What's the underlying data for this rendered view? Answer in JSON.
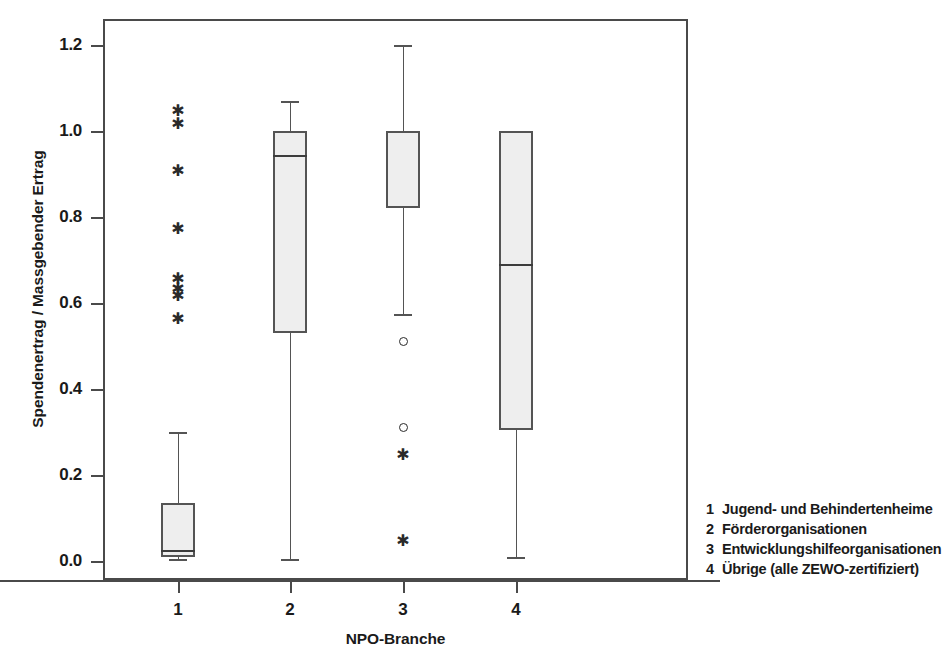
{
  "chart_data": {
    "type": "box",
    "title": "",
    "xlabel": "NPO-Branche",
    "ylabel": "Spendenertrag / Massgebender Ertrag",
    "xlim": [
      0.5,
      4.5
    ],
    "ylim": [
      -0.04,
      1.27
    ],
    "grid": false,
    "legend_position": "right-bottom",
    "x_tick_labels": [
      "1",
      "2",
      "3",
      "4"
    ],
    "y_tick_labels": [
      "0.0",
      "0.2",
      "0.4",
      "0.6",
      "0.8",
      "1.0",
      "1.2"
    ],
    "y_tick_values": [
      0.0,
      0.2,
      0.4,
      0.6,
      0.8,
      1.0,
      1.2
    ],
    "categories": [
      "1",
      "2",
      "3",
      "4"
    ],
    "boxes": [
      {
        "category": "1",
        "name": "Jugend- und Behindertenheime",
        "whisker_low": 0.005,
        "q1": 0.01,
        "median": 0.025,
        "q3": 0.135,
        "whisker_high": 0.3,
        "outliers_mild": [],
        "outliers_extreme": [
          1.04,
          1.01,
          0.9,
          0.765,
          0.65,
          0.625,
          0.61,
          0.555
        ]
      },
      {
        "category": "2",
        "name": "Förderorganisationen",
        "whisker_low": 0.005,
        "q1": 0.53,
        "median": 0.945,
        "q3": 1.0,
        "whisker_high": 1.07,
        "outliers_mild": [],
        "outliers_extreme": []
      },
      {
        "category": "3",
        "name": "Entwicklungshilfeorganisationen",
        "whisker_low": 0.575,
        "q1": 0.82,
        "median": 0.82,
        "q3": 1.0,
        "whisker_high": 1.2,
        "outliers_mild": [
          0.51,
          0.31
        ],
        "outliers_extreme": [
          0.24,
          0.04
        ]
      },
      {
        "category": "4",
        "name": "Übrige (alle ZEWO-zertifiziert)",
        "whisker_low": 0.01,
        "q1": 0.305,
        "median": 0.69,
        "q3": 1.0,
        "whisker_high": 1.0,
        "outliers_mild": [],
        "outliers_extreme": []
      }
    ]
  },
  "legend": {
    "items": [
      {
        "key": "1",
        "label": "Jugend- und Behindertenheime"
      },
      {
        "key": "2",
        "label": "Förderorganisationen"
      },
      {
        "key": "3",
        "label": "Entwicklungshilfeorganisationen"
      },
      {
        "key": "4",
        "label": "Übrige (alle ZEWO-zertifiziert)"
      }
    ]
  },
  "colors": {
    "box_fill": "#eeeeee",
    "box_edge": "#545454",
    "axis": "#4a4a4a",
    "marker": "#2a2a2a",
    "background": "#ffffff"
  },
  "icons": {
    "outlier_mild": "circle-marker-icon",
    "outlier_extreme": "asterisk-marker-icon"
  }
}
